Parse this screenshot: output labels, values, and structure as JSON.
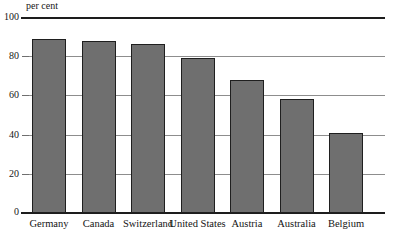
{
  "chart_data": {
    "type": "bar",
    "title": "",
    "subtitle": "",
    "xlabel": "",
    "ylabel": "per cent",
    "ylim": [
      0,
      100
    ],
    "yticks": [
      0,
      20,
      40,
      60,
      80,
      100
    ],
    "grid": true,
    "legend": false,
    "legend_position": "none",
    "orientation": "vertical",
    "categories": [
      "Germany",
      "Canada",
      "Switzerland",
      "United States",
      "Austria",
      "Australia",
      "Belgium"
    ],
    "values": [
      89,
      88,
      86,
      79,
      68,
      58,
      41
    ],
    "series": [
      {
        "name": "per cent",
        "values": [
          89,
          88,
          86,
          79,
          68,
          58,
          41
        ]
      }
    ],
    "annotations": [],
    "colors": {
      "bar_fill": "#6f6f6f",
      "bar_border": "#1f1f1f",
      "gridline": "#8d8d8d",
      "axis_rule": "#1d1d1d",
      "text": "#141414",
      "background": "#ffffff"
    }
  }
}
